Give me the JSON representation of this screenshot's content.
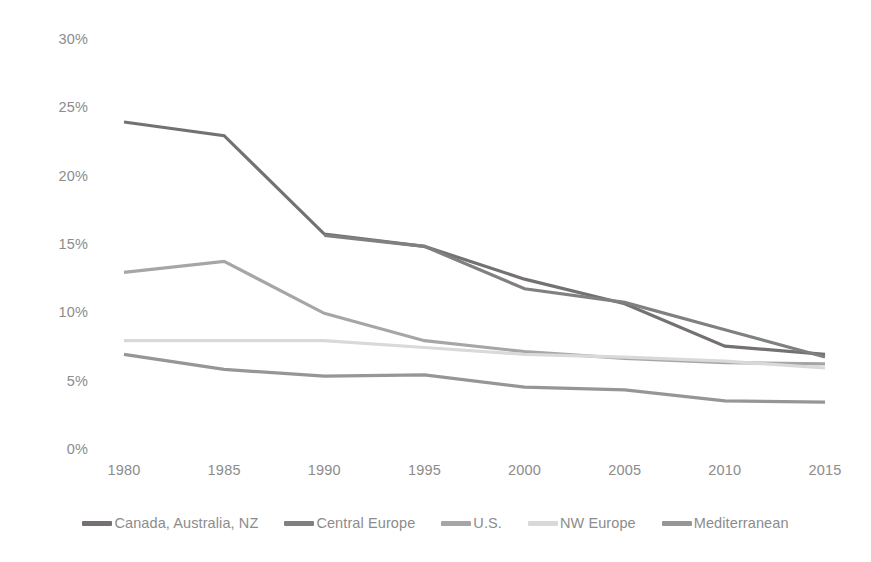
{
  "chart_data": {
    "type": "line",
    "title": "",
    "subtitle": "",
    "xlabel": "",
    "ylabel": "",
    "categories": [
      "1980",
      "1985",
      "1990",
      "1995",
      "2000",
      "2005",
      "2010",
      "2015"
    ],
    "x": [
      1980,
      1985,
      1990,
      1995,
      2000,
      2005,
      2010,
      2015
    ],
    "ytick_labels": [
      "30%",
      "25%",
      "20%",
      "15%",
      "10%",
      "5%",
      "0%"
    ],
    "ytick_values": [
      30,
      25,
      20,
      15,
      10,
      5,
      0
    ],
    "ylim": [
      0,
      30
    ],
    "xlim": [
      1980,
      2015
    ],
    "value_suffix": "%",
    "grid": false,
    "legend_position": "bottom",
    "series": [
      {
        "name": "Canada, Australia, NZ",
        "color": "#767171",
        "values": [
          24.0,
          23.0,
          15.8,
          14.9,
          12.5,
          10.7,
          7.6,
          7.0
        ]
      },
      {
        "name": "Central Europe",
        "color": "#808080",
        "values": [
          null,
          null,
          15.7,
          14.9,
          11.8,
          10.8,
          8.8,
          6.8
        ]
      },
      {
        "name": "U.S.",
        "color": "#a6a6a6",
        "values": [
          13.0,
          13.8,
          10.0,
          8.0,
          7.2,
          6.7,
          6.4,
          6.3
        ]
      },
      {
        "name": "NW Europe",
        "color": "#d9d9d9",
        "values": [
          8.0,
          8.0,
          8.0,
          7.5,
          7.0,
          6.8,
          6.5,
          6.0
        ]
      },
      {
        "name": "Mediterranean",
        "color": "#969696",
        "values": [
          7.0,
          5.9,
          5.4,
          5.5,
          4.6,
          4.4,
          3.6,
          3.5
        ]
      }
    ]
  },
  "legend": {
    "items": [
      {
        "label": "Canada, Australia, NZ",
        "color": "#767171"
      },
      {
        "label": "Central Europe",
        "color": "#808080"
      },
      {
        "label": "U.S.",
        "color": "#a6a6a6"
      },
      {
        "label": "NW Europe",
        "color": "#d9d9d9"
      },
      {
        "label": "Mediterranean",
        "color": "#969696"
      }
    ]
  },
  "axes": {
    "y_tick_labels": [
      "30%",
      "25%",
      "20%",
      "15%",
      "10%",
      "5%",
      "0%"
    ],
    "x_tick_labels": [
      "1980",
      "1985",
      "1990",
      "1995",
      "2000",
      "2005",
      "2010",
      "2015"
    ],
    "tick_color": "#8c8c8c"
  }
}
